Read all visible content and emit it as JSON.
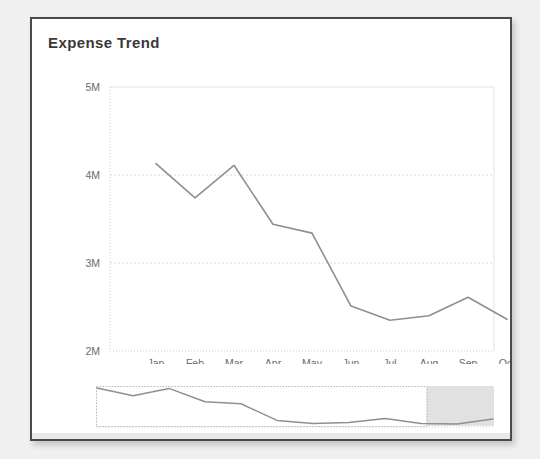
{
  "card": {
    "title": "Expense Trend",
    "background_color": "#ffffff",
    "border_color": "#4a4a4a",
    "line_color": "#8f8f8f"
  },
  "chart_data": {
    "type": "line",
    "title": "Expense Trend",
    "xlabel": "",
    "ylabel": "",
    "categories": [
      "Jan",
      "Feb",
      "Mar",
      "Apr",
      "May",
      "Jun",
      "Jul",
      "Aug",
      "Sep",
      "Oct"
    ],
    "series": [
      {
        "name": "Expense",
        "values": [
          4.13,
          3.74,
          4.11,
          3.44,
          3.34,
          2.51,
          2.35,
          2.4,
          2.61,
          2.36
        ]
      }
    ],
    "ytick_labels": [
      "5M",
      "4M",
      "3M",
      "2M"
    ],
    "ytick_values": [
      5,
      4,
      3,
      2
    ],
    "ylim": [
      2,
      5
    ],
    "yunit": "M",
    "grid": true,
    "legend": false,
    "legend_position": "none"
  },
  "navigator": {
    "name": "range-selector",
    "selection_start_fraction": 0.0,
    "selection_end_fraction": 0.83,
    "series_values": [
      4.13,
      3.74,
      4.11,
      3.44,
      3.34,
      2.51,
      2.35,
      2.4,
      2.61,
      2.36,
      2.33,
      2.58
    ],
    "selected_color": "#ffffff",
    "unselected_color": "#d7d7d7"
  }
}
